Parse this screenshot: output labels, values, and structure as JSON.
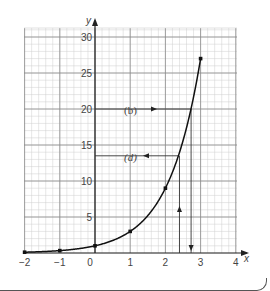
{
  "chart_data": {
    "type": "line",
    "title": "",
    "xlabel": "x",
    "ylabel": "y",
    "xlim": [
      -2,
      4
    ],
    "ylim": [
      0,
      31
    ],
    "x_ticks": [
      -2,
      -1,
      0,
      1,
      2,
      3,
      4
    ],
    "y_ticks": [
      5,
      10,
      15,
      20,
      25,
      30
    ],
    "grid": true,
    "series": [
      {
        "name": "y = 3^x",
        "x": [
          -2,
          -1,
          0,
          1,
          2,
          3
        ],
        "y": [
          0.11,
          0.33,
          1,
          3,
          9,
          27
        ]
      }
    ],
    "annotations": [
      {
        "label": "(b)",
        "type": "horizontal-line",
        "y": 20,
        "from_x": 0,
        "to_x": 2.73,
        "arrow": "right"
      },
      {
        "label": "(d)",
        "type": "horizontal-line",
        "y": 13.5,
        "from_x": 0,
        "to_x": 2.37,
        "arrow": "left"
      },
      {
        "label": "",
        "type": "vertical-line",
        "x": 2.4,
        "from_y": 0,
        "to_y": 13.5,
        "arrow": "up"
      },
      {
        "label": "",
        "type": "vertical-line",
        "x": 2.73,
        "from_y": 20,
        "to_y": 0,
        "arrow": "down"
      }
    ]
  },
  "labels": {
    "x_axis": "x",
    "y_axis": "y",
    "x_tick_labels": [
      "−2",
      "−1",
      "0",
      "1",
      "2",
      "3",
      "4"
    ],
    "y_tick_labels": [
      "5",
      "10",
      "15",
      "20",
      "25",
      "30"
    ],
    "annotation_b": "(b)",
    "annotation_d": "(d)"
  },
  "colors": {
    "grid_minor": "#cfcfcf",
    "grid_major": "#8a8a8a",
    "axis": "#222222",
    "curve": "#111111",
    "text": "#444444"
  }
}
